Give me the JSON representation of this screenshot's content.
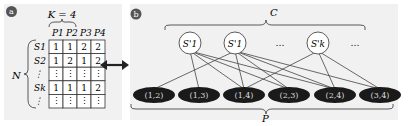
{
  "panel_a": {
    "label": "a",
    "k_label": "K = 4",
    "n_label": "N",
    "columns": [
      "P1",
      "P2",
      "P3",
      "P4"
    ],
    "rows": [
      {
        "label": "S1",
        "values": [
          "1",
          "1",
          "2",
          "2"
        ]
      },
      {
        "label": "S2",
        "values": [
          "1",
          "2",
          "1",
          "2"
        ]
      },
      {
        "label": "⋮",
        "values": [
          "⋮",
          "⋮",
          "⋮",
          "⋮"
        ]
      },
      {
        "label": "Sk",
        "values": [
          "1",
          "1",
          "1",
          "2"
        ]
      },
      {
        "label": "⋮",
        "values": [
          "⋮",
          "⋮",
          "⋮",
          "⋮"
        ]
      }
    ]
  },
  "arrow": "↔",
  "panel_b": {
    "label": "b",
    "c_label": "C",
    "p_label": "P",
    "top_nodes": [
      "S'1",
      "S'1",
      "…",
      "S'k",
      "…"
    ],
    "bottom_nodes": [
      "(1,2)",
      "(1,3)",
      "(1,4)",
      "(2,3)",
      "(2,4)",
      "(3,4)"
    ]
  }
}
